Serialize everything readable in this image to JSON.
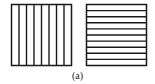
{
  "figure": {
    "caption": "(a)",
    "panels": [
      {
        "name": "vertical-stripes",
        "orientation": "vertical",
        "strips": 8
      },
      {
        "name": "horizontal-stripes",
        "orientation": "horizontal",
        "strips": 10
      }
    ],
    "stroke_color": "#1a1a1a",
    "background_color": "#ffffff"
  }
}
